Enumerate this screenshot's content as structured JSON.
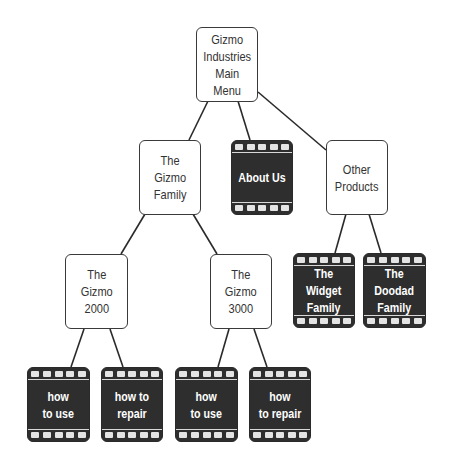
{
  "diagram": {
    "type": "site-map",
    "nodes": {
      "root": {
        "label": "Gizmo\nIndustries\nMain\nMenu",
        "style": "page"
      },
      "gizmo_family": {
        "label": "The\nGizmo\nFamily",
        "style": "page"
      },
      "about_us": {
        "label": "About Us",
        "style": "film"
      },
      "other_products": {
        "label": "Other\nProducts",
        "style": "page"
      },
      "gizmo_2000": {
        "label": "The\nGizmo\n2000",
        "style": "page"
      },
      "gizmo_3000": {
        "label": "The\nGizmo\n3000",
        "style": "page"
      },
      "widget_family": {
        "label": "The\nWidget\nFamily",
        "style": "film"
      },
      "doodad_family": {
        "label": "The\nDoodad\nFamily",
        "style": "film"
      },
      "g2000_how_to_use": {
        "label": "how\nto use",
        "style": "film"
      },
      "g2000_how_to_repair": {
        "label": "how to\nrepair",
        "style": "film"
      },
      "g3000_how_to_use": {
        "label": "how\nto use",
        "style": "film"
      },
      "g3000_how_to_repair": {
        "label": "how\nto repair",
        "style": "film"
      }
    },
    "edges": [
      [
        "root",
        "gizmo_family"
      ],
      [
        "root",
        "about_us"
      ],
      [
        "root",
        "other_products"
      ],
      [
        "gizmo_family",
        "gizmo_2000"
      ],
      [
        "gizmo_family",
        "gizmo_3000"
      ],
      [
        "other_products",
        "widget_family"
      ],
      [
        "other_products",
        "doodad_family"
      ],
      [
        "gizmo_2000",
        "g2000_how_to_use"
      ],
      [
        "gizmo_2000",
        "g2000_how_to_repair"
      ],
      [
        "gizmo_3000",
        "g3000_how_to_use"
      ],
      [
        "gizmo_3000",
        "g3000_how_to_repair"
      ]
    ],
    "colors": {
      "page_fill": "#ffffff",
      "page_border": "#3a3a3a",
      "film_fill": "#2e2e2e",
      "film_text": "#ffffff",
      "sprocket": "#e4e4e4",
      "line": "#2a2a2a"
    }
  }
}
